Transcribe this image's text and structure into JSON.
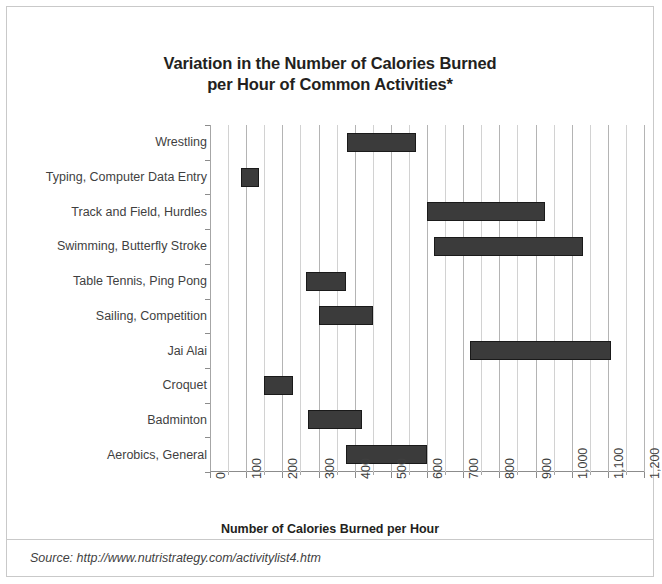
{
  "chart_data": {
    "type": "bar",
    "subtype": "floating-range-bar",
    "title": "Variation in the Number of Calories Burned per Hour of Common Activities*",
    "title_lines": [
      "Variation in the Number of Calories Burned",
      "per Hour of Common Activities*"
    ],
    "xlabel": "Number of Calories Burned per Hour",
    "ylabel": "",
    "xlim": [
      0,
      1200
    ],
    "xticks": [
      0,
      100,
      200,
      300,
      400,
      500,
      600,
      700,
      800,
      900,
      1000,
      1100,
      1200
    ],
    "xtick_labels": [
      "0",
      "100",
      "200",
      "300",
      "400",
      "500",
      "600",
      "700",
      "800",
      "900",
      "1,000",
      "1,100",
      "1,200"
    ],
    "minor_tick_step": 50,
    "grid": "vertical",
    "legend": "none",
    "bar_color": "#3b3b3b",
    "categories": [
      "Wrestling",
      "Typing, Computer Data Entry",
      "Track and Field, Hurdles",
      "Swimming, Butterfly Stroke",
      "Table Tennis, Ping Pong",
      "Sailing, Competition",
      "Jai Alai",
      "Croquet",
      "Badminton",
      "Aerobics, General"
    ],
    "ranges": [
      {
        "category": "Wrestling",
        "low": 380,
        "high": 570
      },
      {
        "category": "Typing, Computer Data Entry",
        "low": 85,
        "high": 135
      },
      {
        "category": "Track and Field, Hurdles",
        "low": 600,
        "high": 925
      },
      {
        "category": "Swimming, Butterfly Stroke",
        "low": 620,
        "high": 1030
      },
      {
        "category": "Table Tennis, Ping Pong",
        "low": 265,
        "high": 375
      },
      {
        "category": "Sailing, Competition",
        "low": 300,
        "high": 450
      },
      {
        "category": "Jai Alai",
        "low": 720,
        "high": 1110
      },
      {
        "category": "Croquet",
        "low": 150,
        "high": 230
      },
      {
        "category": "Badminton",
        "low": 270,
        "high": 420
      },
      {
        "category": "Aerobics, General",
        "low": 375,
        "high": 600
      }
    ]
  },
  "footer": {
    "source": "Source: http://www.nutristrategy.com/activitylist4.htm"
  }
}
